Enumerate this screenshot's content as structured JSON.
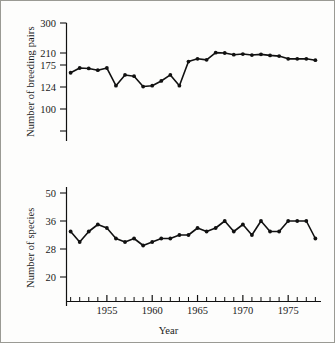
{
  "figure": {
    "x_axis_label": "Year",
    "top_y_axis_label": "Number of breeding pairs",
    "bottom_y_axis_label": "Number of species"
  },
  "chart_data": [
    {
      "type": "line",
      "panel": "top",
      "title": "",
      "xlabel": "Year",
      "ylabel": "Number of breeding pairs",
      "grid": false,
      "legend": "none",
      "xlim": [
        1950,
        1978
      ],
      "xticks": [
        1955,
        1960,
        1965,
        1970,
        1975
      ],
      "xtick_labels": [
        "1955",
        "1960",
        "1965",
        "1970",
        "1975"
      ],
      "yticks": [
        100,
        124,
        175,
        210,
        300
      ],
      "ytick_labels": [
        "100",
        "124",
        "175",
        "210",
        "300"
      ],
      "x": [
        1951,
        1952,
        1953,
        1954,
        1955,
        1956,
        1957,
        1958,
        1959,
        1960,
        1961,
        1962,
        1963,
        1964,
        1965,
        1966,
        1967,
        1968,
        1969,
        1970,
        1971,
        1972,
        1973,
        1974,
        1975,
        1976,
        1977,
        1978
      ],
      "values": [
        157,
        168,
        167,
        163,
        168,
        127,
        152,
        149,
        125,
        127,
        138,
        152,
        127,
        185,
        193,
        190,
        211,
        210,
        205,
        207,
        204,
        206,
        203,
        201,
        193,
        193,
        193,
        189,
        195
      ]
    },
    {
      "type": "line",
      "panel": "bottom",
      "title": "",
      "xlabel": "Year",
      "ylabel": "Number of species",
      "grid": false,
      "legend": "none",
      "xlim": [
        1950,
        1978
      ],
      "xticks": [
        1955,
        1960,
        1965,
        1970,
        1975
      ],
      "xtick_labels": [
        "1955",
        "1960",
        "1965",
        "1970",
        "1975"
      ],
      "yticks": [
        20,
        28,
        36,
        50
      ],
      "ytick_labels": [
        "20",
        "28",
        "36",
        "50"
      ],
      "x": [
        1951,
        1952,
        1953,
        1954,
        1955,
        1956,
        1957,
        1958,
        1959,
        1960,
        1961,
        1962,
        1963,
        1964,
        1965,
        1966,
        1967,
        1968,
        1969,
        1970,
        1971,
        1972,
        1973,
        1974,
        1975,
        1976,
        1977,
        1978
      ],
      "values": [
        33,
        30,
        33,
        35,
        34,
        31,
        30,
        31,
        29,
        30,
        31,
        31,
        32,
        32,
        34,
        33,
        34,
        36,
        33,
        35,
        32,
        36,
        33,
        33,
        36,
        36,
        36,
        31,
        35
      ]
    }
  ]
}
